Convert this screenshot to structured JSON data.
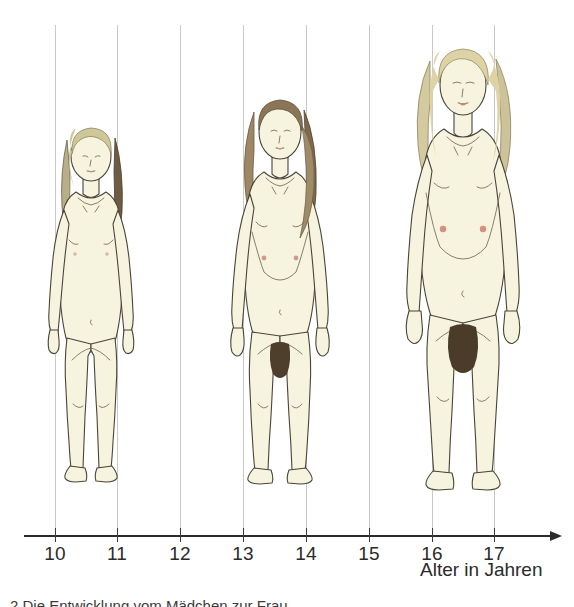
{
  "figure_title": "Die Entwicklung vom Mädchen zur Frau",
  "axis": {
    "title": "Alter in Jahren",
    "ticks": [
      {
        "label": "10",
        "value": 10,
        "x": 55
      },
      {
        "label": "11",
        "value": 11,
        "x": 117
      },
      {
        "label": "12",
        "value": 12,
        "x": 180
      },
      {
        "label": "13",
        "value": 13,
        "x": 243
      },
      {
        "label": "14",
        "value": 14,
        "x": 306
      },
      {
        "label": "15",
        "value": 15,
        "x": 369
      },
      {
        "label": "16",
        "value": 16,
        "x": 432
      },
      {
        "label": "17",
        "value": 17,
        "x": 494
      }
    ],
    "line_y": 535,
    "line_x_start": 24,
    "line_x_end": 552,
    "arrow_label": "axis-arrow-right"
  },
  "gridlines": {
    "top_y": 25,
    "bottom_y": 535,
    "color": "#c9c9c9",
    "x_positions": [
      55,
      117,
      180,
      243,
      306,
      369,
      432,
      494
    ]
  },
  "caption": {
    "text": "2  Die Entwicklung vom Mädchen zur Frau"
  },
  "colors": {
    "skin": "#f6f3df",
    "skin_shade": "#ece7cc",
    "outline": "#4a4438",
    "hair_young": "#cfc79a",
    "hair_mid": "#8b7355",
    "hair_adult": "#d8cfa4",
    "nipple": "#e8b3a8",
    "lips": "#d98f84",
    "pubic": "#5a4a34",
    "gridline": "#c9c9c9",
    "axis": "#2b2b2b",
    "background": "#ffffff"
  },
  "figures": [
    {
      "name": "girl-age-10-11",
      "stage": "Kind / beginnende Pubertät",
      "age_range": "10–11",
      "x": 36,
      "y": 112,
      "width": 110,
      "height": 372,
      "head_top_y": 115,
      "feet_y": 484,
      "features": {
        "breasts": "flach, keine Brustentwicklung",
        "pubic_hair": "keine",
        "hips": "schmal",
        "hair": "hellblond, lang"
      }
    },
    {
      "name": "girl-age-13-14",
      "stage": "Pubertät",
      "age_range": "13–14",
      "x": 218,
      "y": 86,
      "width": 124,
      "height": 400,
      "head_top_y": 88,
      "feet_y": 486,
      "features": {
        "breasts": "beginnende Brustentwicklung",
        "pubic_hair": "vorhanden",
        "hips": "breiter werdend",
        "hair": "dunkelblond, gewellt"
      }
    },
    {
      "name": "woman-age-16-17",
      "stage": "junge Frau",
      "age_range": "16–17",
      "x": 392,
      "y": 33,
      "width": 142,
      "height": 460,
      "head_top_y": 35,
      "feet_y": 493,
      "features": {
        "breasts": "voll entwickelt",
        "pubic_hair": "voll entwickelt",
        "hips": "breit",
        "hair": "blond, schulterlang"
      }
    }
  ],
  "chart_data": {
    "type": "scatter",
    "title": "Die Entwicklung vom Mädchen zur Frau",
    "xlabel": "Alter in Jahren",
    "ylabel": "",
    "xlim": [
      9.5,
      18
    ],
    "categories": [
      "10",
      "11",
      "12",
      "13",
      "14",
      "15",
      "16",
      "17"
    ],
    "grid": true,
    "legend": "none",
    "series": [
      {
        "name": "Körperentwicklung",
        "points": [
          {
            "x": 10.5,
            "label": "Kind",
            "height_px": 372
          },
          {
            "x": 13.5,
            "label": "Pubertät",
            "height_px": 400
          },
          {
            "x": 16.5,
            "label": "junge Frau",
            "height_px": 460
          }
        ]
      }
    ]
  }
}
